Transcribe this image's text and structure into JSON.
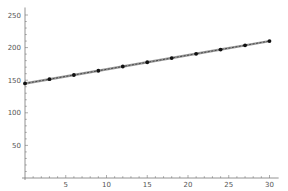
{
  "chart_data": {
    "type": "line",
    "title": "",
    "xlabel": "",
    "ylabel": "",
    "xlim": [
      0,
      31
    ],
    "ylim": [
      0,
      260
    ],
    "grid": false,
    "legend": null,
    "x_ticks": [
      5,
      10,
      15,
      20,
      25,
      30
    ],
    "y_ticks": [
      50,
      100,
      150,
      200,
      250
    ],
    "series": [
      {
        "name": "data",
        "markers": true,
        "line_style": "solid with dashed overlay",
        "color": "#333333",
        "x": [
          0,
          3,
          6,
          9,
          12,
          15,
          18,
          21,
          24,
          27,
          30
        ],
        "values": [
          145,
          151.5,
          158,
          164.5,
          171,
          177.5,
          184,
          190.5,
          197,
          203.5,
          210
        ]
      }
    ]
  }
}
